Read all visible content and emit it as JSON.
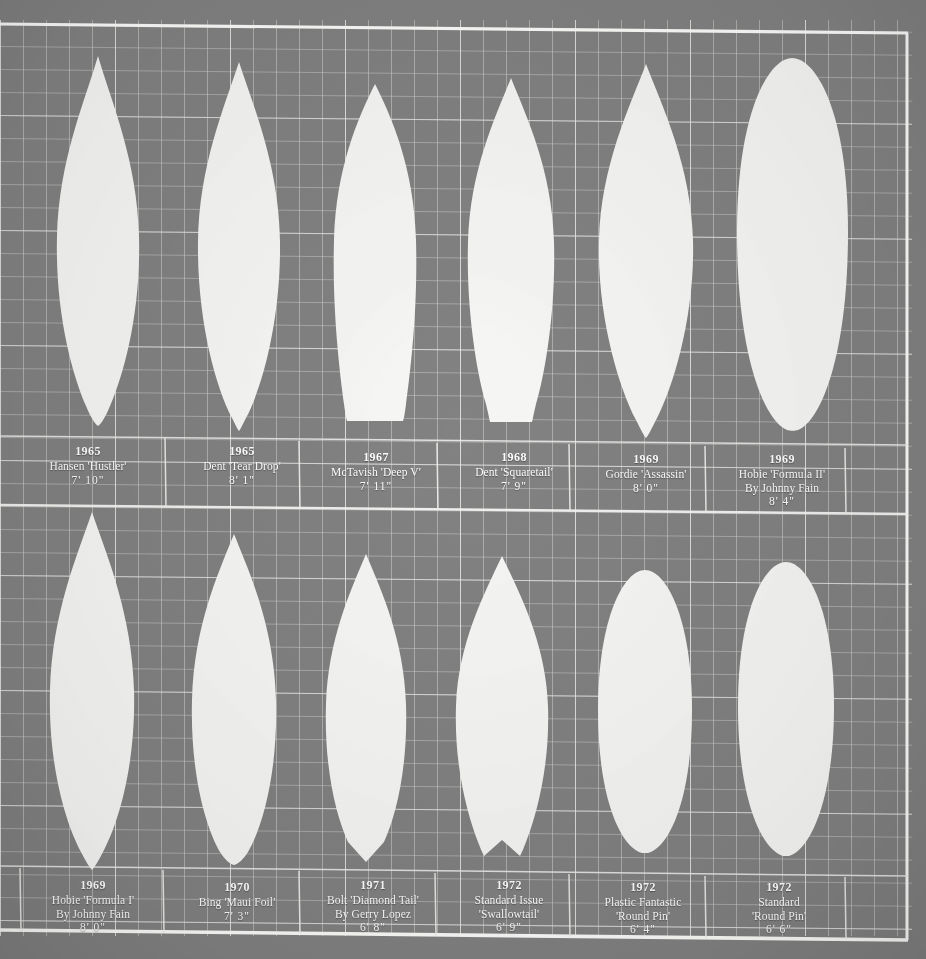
{
  "page": {
    "background_color": "#828282",
    "board_color": "#f6f6f4",
    "grid_line_color": "#e9e9e6",
    "frame_line_color": "#ffffff",
    "text_color": "#ffffff"
  },
  "grid": {
    "cell_size_px": 23,
    "frame_top_y": 25,
    "frame_bottom_y": 934,
    "frame_right_x": 908,
    "row_divider_y": 508
  },
  "boards": [
    {
      "index": 1,
      "year": "1965",
      "name": "Hansen 'Hustler'",
      "maker_line": "",
      "length": "7'  10\"",
      "tail": "round-pin",
      "nose": "pointed",
      "caption_left": 12,
      "caption_top": 442,
      "caption_width": 152
    },
    {
      "index": 2,
      "year": "1965",
      "name": "Dent 'Tear Drop'",
      "maker_line": "",
      "length": "8'  1\"",
      "tail": "pin",
      "nose": "pointed",
      "caption_left": 166,
      "caption_top": 442,
      "caption_width": 152
    },
    {
      "index": 3,
      "year": "1967",
      "name": "McTavish 'Deep V'",
      "maker_line": "",
      "length": "7'  11\"",
      "tail": "squared-round",
      "nose": "rounded-point",
      "caption_left": 300,
      "caption_top": 448,
      "caption_width": 152
    },
    {
      "index": 4,
      "year": "1968",
      "name": "Dent 'Squaretail'",
      "maker_line": "",
      "length": "7'  9\"",
      "tail": "square",
      "nose": "pointed",
      "caption_left": 438,
      "caption_top": 448,
      "caption_width": 152
    },
    {
      "index": 5,
      "year": "1969",
      "name": "Gordie 'Assassin'",
      "maker_line": "",
      "length": "8'  0\"",
      "tail": "pin",
      "nose": "pointed",
      "caption_left": 570,
      "caption_top": 448,
      "caption_width": 152
    },
    {
      "index": 6,
      "year": "1969",
      "name": "Hobie 'Formula II'",
      "maker_line": "By Johnny Fain",
      "length": "8' 4\"",
      "tail": "round",
      "nose": "rounded",
      "caption_left": 706,
      "caption_top": 448,
      "caption_width": 160
    },
    {
      "index": 7,
      "year": "1969",
      "name": "Hobie 'Formula I'",
      "maker_line": "By Johnny Fain",
      "length": "8'  0\"",
      "tail": "round-pin",
      "nose": "pointed",
      "caption_left": 20,
      "caption_top": 876,
      "caption_width": 152
    },
    {
      "index": 8,
      "year": "1970",
      "name": "Bing 'Maui Foil'",
      "maker_line": "",
      "length": "7'  3\"",
      "tail": "round-pin",
      "nose": "pointed",
      "caption_left": 164,
      "caption_top": 876,
      "caption_width": 152
    },
    {
      "index": 9,
      "year": "1971",
      "name": "Bolt 'Diamond Tail'",
      "maker_line": "By Gerry Lopez",
      "length": "6'  8\"",
      "tail": "diamond",
      "nose": "pointed",
      "caption_left": 300,
      "caption_top": 876,
      "caption_width": 152
    },
    {
      "index": 10,
      "year": "1972",
      "name": "Standard Issue",
      "maker_line": "'Swallowtail'",
      "length": "6'  9\"",
      "tail": "swallow",
      "nose": "pointed",
      "caption_left": 436,
      "caption_top": 876,
      "caption_width": 152
    },
    {
      "index": 11,
      "year": "1972",
      "name": "Plastic Fantastic",
      "maker_line": "'Round Pin'",
      "length": "6'  4\"",
      "tail": "round-pin",
      "nose": "rounded",
      "caption_left": 570,
      "caption_top": 876,
      "caption_width": 152
    },
    {
      "index": 12,
      "year": "1972",
      "name": "Standard",
      "maker_line": "'Round Pin'",
      "length": "6'  6\"",
      "tail": "round-pin",
      "nose": "rounded",
      "caption_left": 706,
      "caption_top": 876,
      "caption_width": 152
    }
  ]
}
